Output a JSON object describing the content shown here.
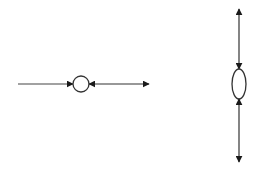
{
  "diagram": {
    "background": "#ffffff",
    "stroke_color": "#1a1a1a",
    "left_figure": {
      "shape": "circle",
      "center": [
        81,
        84
      ],
      "radius": 8,
      "incoming_left": {
        "from": [
          18,
          84
        ],
        "to": [
          72,
          84
        ],
        "head": "right"
      },
      "outgoing_right": {
        "from": [
          90,
          84
        ],
        "to": [
          148,
          84
        ],
        "heads": [
          "left",
          "right"
        ]
      }
    },
    "right_figure": {
      "shape": "ellipse",
      "center": [
        239,
        84
      ],
      "rx": 7,
      "ry": 15,
      "upper_arrow": {
        "from": [
          239,
          10
        ],
        "to": [
          239,
          68
        ],
        "heads": [
          "up",
          "down"
        ]
      },
      "lower_arrow": {
        "from": [
          239,
          100
        ],
        "to": [
          239,
          161
        ],
        "heads": [
          "up",
          "down"
        ]
      }
    }
  }
}
